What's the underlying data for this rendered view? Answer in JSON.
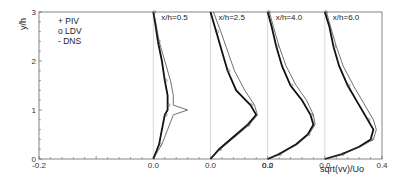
{
  "chart_data": {
    "type": "line",
    "title": "",
    "xlabel": "sqrt(vv)/Uo",
    "ylabel": "y/h",
    "xlim": [
      -0.2,
      0.4
    ],
    "ylim": [
      0,
      3
    ],
    "grid": false,
    "legend_position": "upper-left",
    "x_tick_labels": [
      "-0.2",
      "0.0",
      "0.0",
      "0.0",
      "0.0",
      "0.2",
      "0.4"
    ],
    "x_tick_values": [
      -0.2,
      0.0,
      0.1,
      0.2,
      0.3,
      0.2,
      0.4
    ],
    "y_tick_labels": [
      "0",
      "1",
      "2",
      "3"
    ],
    "legend": [
      {
        "marker": "+",
        "label": "PIV"
      },
      {
        "marker": "o",
        "label": "LDV"
      },
      {
        "marker": "-",
        "label": "DNS"
      }
    ],
    "profile_offset_step": 0.1,
    "profiles": [
      {
        "label": "x/h=0.5",
        "offset": 0.0,
        "y": [
          0,
          0.3,
          0.6,
          0.9,
          1.0,
          1.1,
          1.3,
          1.6,
          2.0,
          2.4,
          2.8,
          3.0
        ],
        "series": [
          {
            "name": "PIV",
            "values": [
              0.0,
              0.01,
              0.015,
              0.02,
              0.025,
              0.025,
              0.025,
              0.02,
              0.015,
              0.008,
              0.003,
              0.0
            ]
          },
          {
            "name": "LDV",
            "values": [
              0.0,
              0.01,
              0.015,
              0.02,
              0.025,
              0.025,
              0.025,
              0.02,
              0.015,
              0.008,
              0.003,
              0.0
            ]
          },
          {
            "name": "DNS",
            "values": [
              0.0,
              0.015,
              0.025,
              0.035,
              0.06,
              0.035,
              0.035,
              0.03,
              0.02,
              0.01,
              0.004,
              0.0
            ]
          }
        ]
      },
      {
        "label": "x/h=2.5",
        "offset": 0.1,
        "y": [
          0,
          0.2,
          0.5,
          0.7,
          0.9,
          1.1,
          1.4,
          1.8,
          2.2,
          2.6,
          3.0
        ],
        "series": [
          {
            "name": "PIV",
            "values": [
              0.0,
              0.015,
              0.045,
              0.065,
              0.08,
              0.07,
              0.045,
              0.03,
              0.02,
              0.01,
              0.0
            ]
          },
          {
            "name": "LDV",
            "values": [
              0.0,
              0.015,
              0.045,
              0.065,
              0.08,
              0.07,
              0.045,
              0.03,
              0.02,
              0.01,
              0.0
            ]
          },
          {
            "name": "DNS",
            "values": [
              0.0,
              0.017,
              0.048,
              0.068,
              0.082,
              0.077,
              0.06,
              0.042,
              0.03,
              0.018,
              0.005
            ]
          }
        ]
      },
      {
        "label": "x/h=4.0",
        "offset": 0.2,
        "y": [
          0,
          0.1,
          0.3,
          0.5,
          0.7,
          0.9,
          1.2,
          1.5,
          1.9,
          2.3,
          2.7,
          3.0
        ],
        "series": [
          {
            "name": "PIV",
            "values": [
              0.0,
              0.02,
              0.05,
              0.07,
              0.08,
              0.075,
              0.06,
              0.04,
              0.025,
              0.015,
              0.007,
              0.0
            ]
          },
          {
            "name": "LDV",
            "values": [
              0.0,
              0.02,
              0.05,
              0.07,
              0.08,
              0.075,
              0.06,
              0.04,
              0.025,
              0.015,
              0.007,
              0.0
            ]
          },
          {
            "name": "DNS",
            "values": [
              0.0,
              0.02,
              0.052,
              0.072,
              0.083,
              0.08,
              0.068,
              0.05,
              0.032,
              0.02,
              0.01,
              0.003
            ]
          }
        ]
      },
      {
        "label": "x/h=6.0",
        "offset": 0.3,
        "y": [
          0,
          0.1,
          0.25,
          0.4,
          0.6,
          0.8,
          1.1,
          1.5,
          1.9,
          2.3,
          2.7,
          3.0
        ],
        "series": [
          {
            "name": "PIV",
            "values": [
              0.0,
              0.03,
              0.06,
              0.08,
              0.085,
              0.075,
              0.06,
              0.04,
              0.025,
              0.015,
              0.008,
              0.0
            ]
          },
          {
            "name": "LDV",
            "values": [
              0.0,
              0.03,
              0.06,
              0.08,
              0.085,
              0.075,
              0.06,
              0.04,
              0.025,
              0.015,
              0.008,
              0.0
            ]
          },
          {
            "name": "DNS",
            "values": [
              0.0,
              0.03,
              0.062,
              0.085,
              0.09,
              0.085,
              0.07,
              0.05,
              0.032,
              0.02,
              0.01,
              0.003
            ]
          }
        ]
      }
    ]
  },
  "labels": {
    "ylabel": "y/h",
    "xlabel": "sqrt(vv)/Uo",
    "legend_piv": "+ PIV",
    "legend_ldv": "o LDV",
    "legend_dns": "- DNS"
  }
}
